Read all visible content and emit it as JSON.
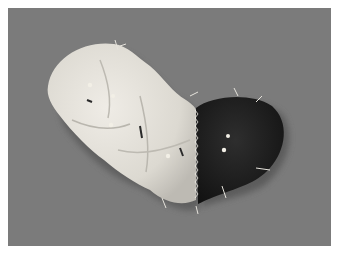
{
  "image": {
    "description": "Photograph of a partially sewn padded fabric object: a light cream quilted section joined to a dark section with a zigzag edge stitch, held with pins, on a gray background",
    "colors": {
      "border": "#ffffff",
      "background": "#7b7b7b",
      "light_fabric": "#e4e1da",
      "dark_fabric": "#1e1e1e",
      "pin_head": "#f2efe6"
    }
  }
}
